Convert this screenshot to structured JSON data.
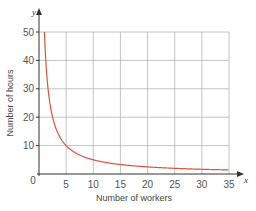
{
  "chart_data": {
    "type": "line",
    "title": "",
    "xlabel": "Number of workers",
    "ylabel": "Number of hours",
    "x_axis_letter": "x",
    "y_axis_letter": "y",
    "xlim": [
      0,
      35
    ],
    "ylim": [
      0,
      50
    ],
    "x_ticks": [
      0,
      5,
      10,
      15,
      20,
      25,
      30,
      35
    ],
    "y_ticks": [
      10,
      20,
      30,
      40,
      50
    ],
    "origin_label": "0",
    "grid": true,
    "legend": null,
    "series": [
      {
        "name": "y = 50/x",
        "color": "#e0533a",
        "x": [
          1,
          1.25,
          1.5,
          2,
          2.5,
          3,
          4,
          5,
          6,
          8,
          10,
          12.5,
          15,
          20,
          25,
          30,
          35
        ],
        "values": [
          50,
          40,
          33.3,
          25,
          20,
          16.7,
          12.5,
          10,
          8.3,
          6.25,
          5,
          4,
          3.3,
          2.5,
          2,
          1.7,
          1.4
        ]
      }
    ]
  },
  "colors": {
    "grid": "#b5b5b5",
    "axis": "#333333",
    "curve": "#e0533a"
  }
}
